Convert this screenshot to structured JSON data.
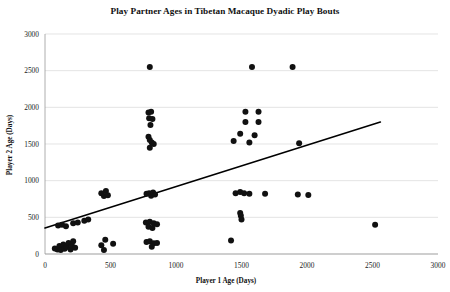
{
  "chart_data": {
    "type": "scatter",
    "title": "Play Partner Ages in Tibetan Macaque Dyadic Play Bouts",
    "xlabel": "Player 1 Age (Days)",
    "ylabel": "Player 2 Age (Days)",
    "xlim": [
      0,
      3000
    ],
    "ylim": [
      0,
      3000
    ],
    "xticks": [
      0,
      500,
      1000,
      1500,
      2000,
      2500,
      3000
    ],
    "yticks": [
      0,
      500,
      1000,
      1500,
      2000,
      2500,
      3000
    ],
    "xtick_labels": [
      "0",
      "500",
      "1000",
      "1500",
      "2000",
      "2500",
      "3000"
    ],
    "ytick_labels": [
      "0",
      "500",
      "1000",
      "1500",
      "2000",
      "2500",
      "3000"
    ],
    "grid": "horizontal",
    "legend": "none",
    "marker_color": "#111111",
    "marker_size": 3.0,
    "grid_color": "#d9d9d9",
    "trendline": {
      "visible": true,
      "color": "#000000",
      "x_start": 0,
      "y_start": 355,
      "x_end": 2560,
      "y_end": 1800
    },
    "points": [
      {
        "x": 75,
        "y": 75
      },
      {
        "x": 95,
        "y": 60
      },
      {
        "x": 110,
        "y": 110
      },
      {
        "x": 120,
        "y": 55
      },
      {
        "x": 140,
        "y": 130
      },
      {
        "x": 150,
        "y": 70
      },
      {
        "x": 165,
        "y": 95
      },
      {
        "x": 180,
        "y": 150
      },
      {
        "x": 195,
        "y": 60
      },
      {
        "x": 205,
        "y": 115
      },
      {
        "x": 215,
        "y": 175
      },
      {
        "x": 230,
        "y": 85
      },
      {
        "x": 100,
        "y": 390
      },
      {
        "x": 130,
        "y": 400
      },
      {
        "x": 160,
        "y": 380
      },
      {
        "x": 215,
        "y": 420
      },
      {
        "x": 250,
        "y": 430
      },
      {
        "x": 300,
        "y": 455
      },
      {
        "x": 330,
        "y": 470
      },
      {
        "x": 430,
        "y": 830
      },
      {
        "x": 450,
        "y": 790
      },
      {
        "x": 465,
        "y": 860
      },
      {
        "x": 480,
        "y": 800
      },
      {
        "x": 430,
        "y": 120
      },
      {
        "x": 450,
        "y": 55
      },
      {
        "x": 460,
        "y": 195
      },
      {
        "x": 520,
        "y": 140
      },
      {
        "x": 800,
        "y": 2550
      },
      {
        "x": 790,
        "y": 1930
      },
      {
        "x": 810,
        "y": 1940
      },
      {
        "x": 795,
        "y": 1850
      },
      {
        "x": 820,
        "y": 1840
      },
      {
        "x": 805,
        "y": 1760
      },
      {
        "x": 790,
        "y": 1600
      },
      {
        "x": 800,
        "y": 1555
      },
      {
        "x": 815,
        "y": 1520
      },
      {
        "x": 830,
        "y": 1500
      },
      {
        "x": 800,
        "y": 1450
      },
      {
        "x": 775,
        "y": 820
      },
      {
        "x": 795,
        "y": 830
      },
      {
        "x": 810,
        "y": 795
      },
      {
        "x": 825,
        "y": 840
      },
      {
        "x": 840,
        "y": 810
      },
      {
        "x": 770,
        "y": 430
      },
      {
        "x": 800,
        "y": 440
      },
      {
        "x": 830,
        "y": 420
      },
      {
        "x": 855,
        "y": 405
      },
      {
        "x": 790,
        "y": 370
      },
      {
        "x": 820,
        "y": 355
      },
      {
        "x": 775,
        "y": 165
      },
      {
        "x": 800,
        "y": 175
      },
      {
        "x": 830,
        "y": 145
      },
      {
        "x": 855,
        "y": 150
      },
      {
        "x": 815,
        "y": 100
      },
      {
        "x": 1580,
        "y": 2550
      },
      {
        "x": 1890,
        "y": 2550
      },
      {
        "x": 1530,
        "y": 1940
      },
      {
        "x": 1630,
        "y": 1940
      },
      {
        "x": 1530,
        "y": 1800
      },
      {
        "x": 1630,
        "y": 1800
      },
      {
        "x": 1490,
        "y": 1640
      },
      {
        "x": 1600,
        "y": 1620
      },
      {
        "x": 1440,
        "y": 1540
      },
      {
        "x": 1560,
        "y": 1520
      },
      {
        "x": 1940,
        "y": 1510
      },
      {
        "x": 1455,
        "y": 830
      },
      {
        "x": 1490,
        "y": 845
      },
      {
        "x": 1520,
        "y": 830
      },
      {
        "x": 1560,
        "y": 820
      },
      {
        "x": 1680,
        "y": 820
      },
      {
        "x": 1930,
        "y": 810
      },
      {
        "x": 2010,
        "y": 805
      },
      {
        "x": 1490,
        "y": 560
      },
      {
        "x": 1495,
        "y": 520
      },
      {
        "x": 1500,
        "y": 470
      },
      {
        "x": 1420,
        "y": 185
      },
      {
        "x": 2520,
        "y": 400
      }
    ]
  }
}
